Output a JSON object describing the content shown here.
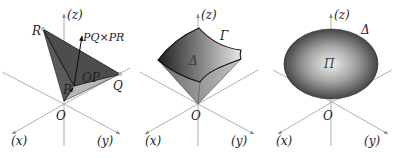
{
  "figure": {
    "panels": [
      {
        "id": "parallelogram-cross-product",
        "axes": {
          "z": "(z)",
          "x": "(x)",
          "y": "(y)",
          "origin": "O"
        },
        "points": {
          "R": "R",
          "P": "P",
          "Q": "Q"
        },
        "vectors": {
          "normal": "PQ×PR",
          "position": "OP"
        }
      },
      {
        "id": "surface-patch",
        "axes": {
          "z": "(z)",
          "x": "(x)",
          "y": "(y)",
          "origin": "O"
        },
        "region": "Δ",
        "boundary": "Γ"
      },
      {
        "id": "closed-surface",
        "axes": {
          "z": "(z)",
          "x": "(x)",
          "y": "(y)",
          "origin": "O"
        },
        "region": "Π",
        "volume": "Δ"
      }
    ]
  },
  "colors": {
    "axis": "#a8a8a8",
    "dark_fill": "#4a4a4a",
    "mid_fill": "#8a8a8a",
    "light_fill": "#b5b5b5",
    "text": "#222222"
  }
}
